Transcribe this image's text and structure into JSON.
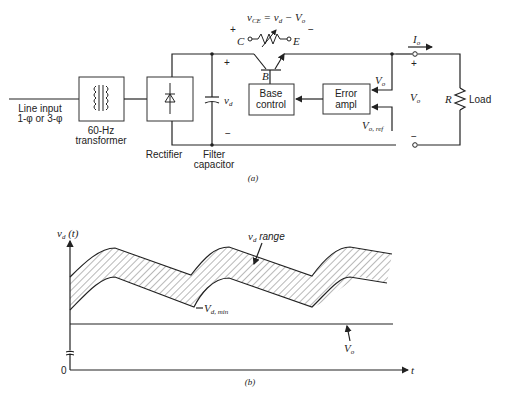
{
  "figure_a": {
    "caption": "(a)",
    "line_input": [
      "Line input",
      "1-φ or 3-φ"
    ],
    "transformer": [
      "60-Hz",
      "transformer"
    ],
    "rectifier": "Rectifier",
    "filter_capacitor": [
      "Filter",
      "capacitor"
    ],
    "vd": "v",
    "vd_sub": "d",
    "vce_eq": {
      "lhs": "v",
      "lhs_sub": "CE",
      "mid": " = v",
      "mid_sub": "d",
      "rhs": " − V",
      "rhs_sub": "o"
    },
    "c_label": "C",
    "e_label": "E",
    "b_label": "B",
    "plus": "+",
    "minus": "−",
    "base_control": [
      "Base",
      "control"
    ],
    "error_ampl": [
      "Error",
      "ampl"
    ],
    "vo": "V",
    "vo_sub": "o",
    "vo_ref_sub": "o, ref",
    "io": "I",
    "io_sub": "o",
    "r_label": "R",
    "load": "Load"
  },
  "figure_b": {
    "caption": "(b)",
    "y_axis": "v",
    "y_axis_sub": "d",
    "y_axis_suffix": " (t)",
    "x_axis": "t",
    "origin": "0",
    "vd_range": " range",
    "vd_min": "V",
    "vd_min_sub": "d, min",
    "vo": "V",
    "vo_sub": "o"
  }
}
